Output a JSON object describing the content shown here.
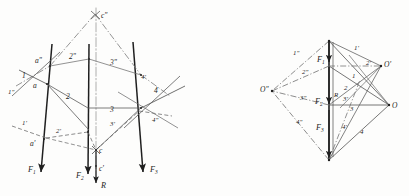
{
  "figure": {
    "background_color": "#fdfdfc",
    "ink_color": "#2b2b2b",
    "thin_color": "#565656",
    "dash_color": "#6a6a6a",
    "left_diagram": {
      "name": "funicular-polygon",
      "forces": [
        {
          "id": "F1",
          "base": "F",
          "sub": "1",
          "label": "F₁"
        },
        {
          "id": "F2",
          "base": "F",
          "sub": "2",
          "label": "F₂"
        },
        {
          "id": "F3",
          "base": "F",
          "sub": "3",
          "label": "F₃"
        },
        {
          "id": "R",
          "base": "R",
          "sub": "",
          "label": "R"
        }
      ],
      "points": [
        {
          "id": "a",
          "label": "a"
        },
        {
          "id": "a1",
          "label": "a'"
        },
        {
          "id": "a2",
          "label": "a\""
        },
        {
          "id": "c",
          "label": "c"
        },
        {
          "id": "c1",
          "label": "c'"
        },
        {
          "id": "c2",
          "label": "c\""
        }
      ],
      "rays": [
        {
          "id": "r1",
          "label": "1"
        },
        {
          "id": "r1p",
          "label": "1'"
        },
        {
          "id": "r1pp",
          "label": "1\""
        },
        {
          "id": "r2",
          "label": "2"
        },
        {
          "id": "r2p",
          "label": "2'"
        },
        {
          "id": "r2pp",
          "label": "2\""
        },
        {
          "id": "r3",
          "label": "3"
        },
        {
          "id": "r3p",
          "label": "3'"
        },
        {
          "id": "r3pp",
          "label": "3\""
        },
        {
          "id": "r4",
          "label": "4"
        },
        {
          "id": "r4p",
          "label": "4'"
        },
        {
          "id": "r4pp",
          "label": "4\""
        }
      ]
    },
    "right_diagram": {
      "name": "force-polygon",
      "poles": [
        {
          "id": "O",
          "label": "O"
        },
        {
          "id": "Op",
          "label": "O'"
        },
        {
          "id": "Opp",
          "label": "O\""
        }
      ],
      "forces": [
        {
          "id": "F1",
          "base": "F",
          "sub": "1",
          "label": "F₁"
        },
        {
          "id": "F2",
          "base": "F",
          "sub": "2",
          "label": "F₂"
        },
        {
          "id": "F3",
          "base": "F",
          "sub": "3",
          "label": "F₃"
        },
        {
          "id": "R",
          "base": "R",
          "sub": "",
          "label": "R"
        }
      ],
      "rays": [
        {
          "id": "r1",
          "label": "1"
        },
        {
          "id": "r1p",
          "label": "1'"
        },
        {
          "id": "r1pp",
          "label": "1\""
        },
        {
          "id": "r2",
          "label": "2"
        },
        {
          "id": "r2p",
          "label": "2'"
        },
        {
          "id": "r2pp",
          "label": "2\""
        },
        {
          "id": "r3",
          "label": "3"
        },
        {
          "id": "r3p",
          "label": "3'"
        },
        {
          "id": "r3pp",
          "label": "3\""
        },
        {
          "id": "r4",
          "label": "4"
        },
        {
          "id": "r4p",
          "label": "4'"
        },
        {
          "id": "r4pp",
          "label": "4\""
        }
      ]
    }
  }
}
